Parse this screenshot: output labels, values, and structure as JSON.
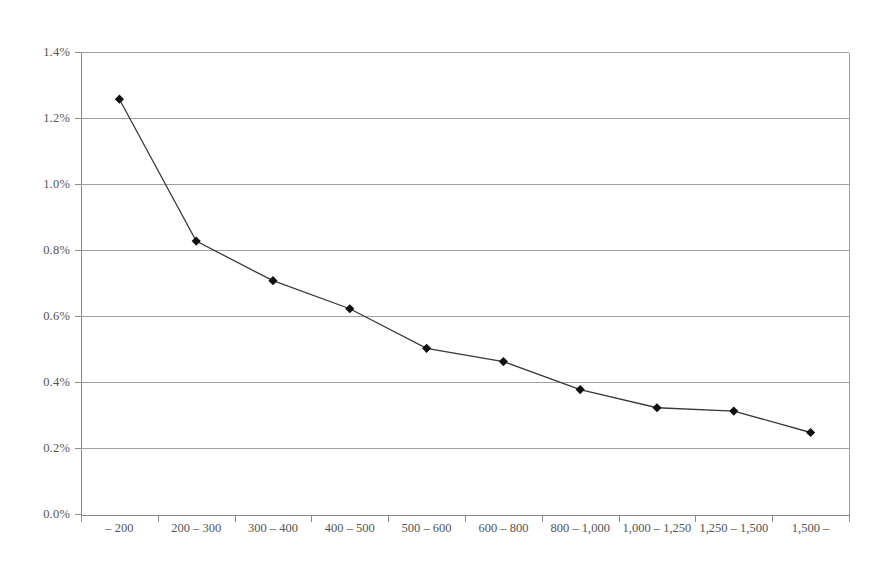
{
  "chart_data": {
    "type": "line",
    "title": "",
    "subtitle": "",
    "xlabel": "",
    "ylabel": "",
    "categories": [
      "– 200",
      "200 – 300",
      "300 – 400",
      "400 – 500",
      "500 – 600",
      "600 – 800",
      "800 – 1,000",
      "1,000 – 1,250",
      "1,250 – 1,500",
      "1,500 –"
    ],
    "values": [
      1.26,
      0.83,
      0.71,
      0.625,
      0.505,
      0.465,
      0.38,
      0.325,
      0.315,
      0.25
    ],
    "value_suffix": "%",
    "ylim": [
      0.0,
      1.4
    ],
    "ytick_values": [
      0.0,
      0.2,
      0.4,
      0.6,
      0.8,
      1.0,
      1.2,
      1.4
    ],
    "ytick_labels": [
      "0.0%",
      "0.2%",
      "0.4%",
      "0.6%",
      "0.8%",
      "1.0%",
      "1.2%",
      "1.4%"
    ],
    "grid": true,
    "grid_axis": "y",
    "legend": false,
    "legend_position": "none",
    "marker": "diamond",
    "series": [
      {
        "name": "",
        "values": [
          1.26,
          0.83,
          0.71,
          0.625,
          0.505,
          0.465,
          0.38,
          0.325,
          0.315,
          0.25
        ]
      }
    ]
  },
  "style": {
    "background_color": "#ffffff",
    "grid_color": "#9f9f9f",
    "axis_color": "#8a8a8a",
    "line_color": "#3a3a3a",
    "marker_color": "#111111",
    "tick_text_color": "#555555"
  }
}
